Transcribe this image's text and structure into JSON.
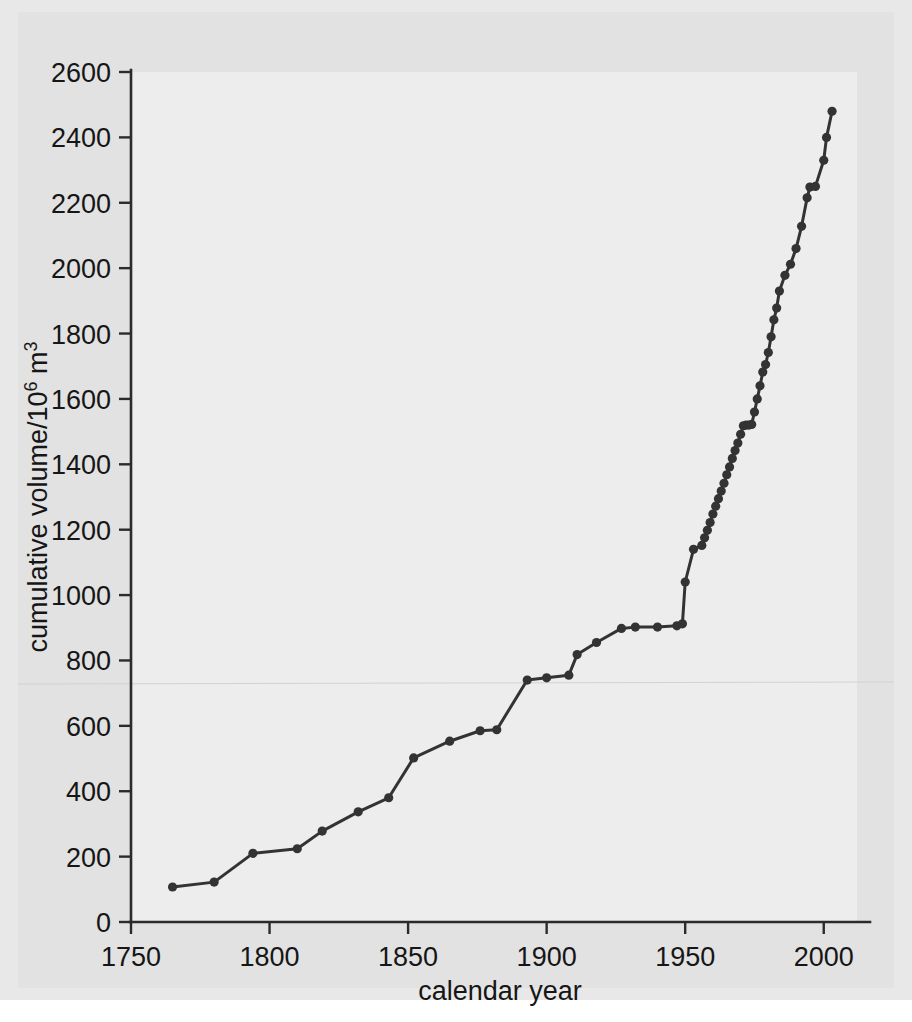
{
  "figure": {
    "background_color": "#e8e8e8",
    "mat_color": "#e2e2e2",
    "plot_background_color": "#ededed",
    "series_color": "#333333",
    "axis_color": "#2b2b2b"
  },
  "chart_data": {
    "type": "line",
    "title": "",
    "xlabel": "calendar year",
    "ylabel": "cumulative volume/10⁶ m³",
    "ylabel_main": "cumulative volume/10",
    "ylabel_exponent": "6",
    "ylabel_unit": " m",
    "ylabel_unit_exponent": "3",
    "xlim": [
      1750,
      2012
    ],
    "ylim": [
      0,
      2600
    ],
    "xticks": [
      1750,
      1800,
      1850,
      1900,
      1950,
      2000
    ],
    "xticklabels": [
      "1750",
      "1800",
      "1850",
      "1900",
      "1950",
      "2000"
    ],
    "yticks": [
      0,
      200,
      400,
      600,
      800,
      1000,
      1200,
      1400,
      1600,
      1800,
      2000,
      2200,
      2400,
      2600
    ],
    "yticklabels": [
      "0",
      "200",
      "400",
      "600",
      "800",
      "1000",
      "1200",
      "1400",
      "1600",
      "1800",
      "2000",
      "2200",
      "2400",
      "2600"
    ],
    "grid": false,
    "legend": null,
    "markers": "filled-circle",
    "series": [
      {
        "name": "cumulative volume",
        "x": [
          1765,
          1780,
          1794,
          1810,
          1819,
          1832,
          1843,
          1852,
          1865,
          1876,
          1882,
          1893,
          1900,
          1908,
          1911,
          1918,
          1927,
          1932,
          1940,
          1947,
          1949,
          1950,
          1953,
          1956,
          1957,
          1958,
          1959,
          1960,
          1961,
          1962,
          1963,
          1964,
          1965,
          1966,
          1967,
          1968,
          1969,
          1970,
          1971,
          1972,
          1973,
          1974,
          1975,
          1976,
          1977,
          1978,
          1979,
          1980,
          1981,
          1982,
          1983,
          1984,
          1986,
          1988,
          1990,
          1992,
          1994,
          1995,
          1997,
          2000,
          2001,
          2003
        ],
        "values": [
          107,
          122,
          210,
          224,
          278,
          337,
          380,
          502,
          553,
          585,
          588,
          740,
          747,
          755,
          818,
          855,
          898,
          902,
          902,
          906,
          912,
          1040,
          1140,
          1152,
          1175,
          1198,
          1222,
          1248,
          1272,
          1295,
          1318,
          1342,
          1368,
          1392,
          1418,
          1442,
          1465,
          1492,
          1518,
          1520,
          1520,
          1522,
          1560,
          1600,
          1640,
          1682,
          1705,
          1742,
          1790,
          1842,
          1878,
          1930,
          1978,
          2012,
          2060,
          2128,
          2215,
          2248,
          2250,
          2330,
          2400,
          2480
        ]
      }
    ]
  }
}
